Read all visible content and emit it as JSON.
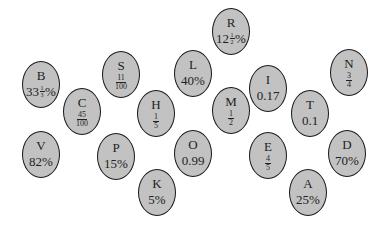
{
  "nodes": [
    {
      "id": "R",
      "letter": "R",
      "value_type": "mixed",
      "whole": "12",
      "num": "1",
      "den": "2",
      "suffix": "%",
      "x": 231,
      "y": 31
    },
    {
      "id": "B",
      "letter": "B",
      "value_type": "mixed",
      "whole": "33",
      "num": "1",
      "den": "3",
      "suffix": "%",
      "x": 41,
      "y": 84
    },
    {
      "id": "S",
      "letter": "S",
      "value_type": "fraction",
      "num": "11",
      "den": "100",
      "x": 121,
      "y": 74
    },
    {
      "id": "L",
      "letter": "L",
      "value_type": "text",
      "text": "40%",
      "x": 193,
      "y": 73
    },
    {
      "id": "I",
      "letter": "I",
      "value_type": "text",
      "text": "0.17",
      "x": 268,
      "y": 88
    },
    {
      "id": "N",
      "letter": "N",
      "value_type": "fraction",
      "num": "3",
      "den": "4",
      "x": 349,
      "y": 72
    },
    {
      "id": "C",
      "letter": "C",
      "value_type": "fraction",
      "num": "45",
      "den": "100",
      "x": 82,
      "y": 111
    },
    {
      "id": "H",
      "letter": "H",
      "value_type": "fraction",
      "num": "1",
      "den": "5",
      "x": 156,
      "y": 113
    },
    {
      "id": "M",
      "letter": "M",
      "value_type": "fraction",
      "num": "1",
      "den": "2",
      "x": 231,
      "y": 110
    },
    {
      "id": "T",
      "letter": "T",
      "value_type": "text",
      "text": "0.1",
      "x": 310,
      "y": 113
    },
    {
      "id": "V",
      "letter": "V",
      "value_type": "text",
      "text": "82%",
      "x": 41,
      "y": 154
    },
    {
      "id": "P",
      "letter": "P",
      "value_type": "text",
      "text": "15%",
      "x": 116,
      "y": 156
    },
    {
      "id": "O",
      "letter": "O",
      "value_type": "text",
      "text": "0.99",
      "x": 193,
      "y": 153
    },
    {
      "id": "E",
      "letter": "E",
      "value_type": "fraction",
      "num": "4",
      "den": "5",
      "x": 268,
      "y": 155
    },
    {
      "id": "D",
      "letter": "D",
      "value_type": "text",
      "text": "70%",
      "x": 347,
      "y": 153
    },
    {
      "id": "K",
      "letter": "K",
      "value_type": "text",
      "text": "5%",
      "x": 157,
      "y": 192
    },
    {
      "id": "A",
      "letter": "A",
      "value_type": "text",
      "text": "25%",
      "x": 308,
      "y": 192
    }
  ],
  "style": {
    "fill": "#c2c2c2",
    "stroke": "#1a1a1a",
    "background": "#ffffff"
  }
}
